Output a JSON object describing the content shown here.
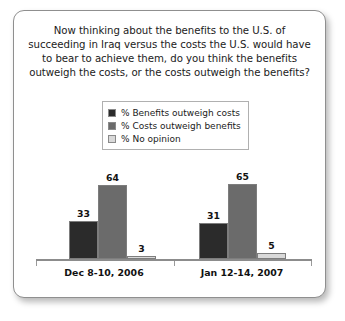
{
  "card": {
    "title": "Now thinking about the benefits to the U.S. of succeeding in Iraq versus the costs the U.S. would have to bear to achieve them, do you think the benefits outweigh the costs, or the costs outweigh the benefits?"
  },
  "chart_data": {
    "type": "bar",
    "title": "Now thinking about the benefits to the U.S. of succeeding in Iraq versus the costs the U.S. would have to bear to achieve them, do you think the benefits outweigh the costs, or the costs outweigh the benefits?",
    "xlabel": "",
    "ylabel": "",
    "ylim": [
      0,
      100
    ],
    "grid": false,
    "legend_position": "top-center",
    "categories": [
      "Dec 8-10, 2006",
      "Jan 12-14, 2007"
    ],
    "series": [
      {
        "name": "% Benefits outweigh costs",
        "color": "#2b2b2b",
        "values": [
          33,
          31
        ]
      },
      {
        "name": "% Costs outweigh benefits",
        "color": "#6b6b6b",
        "values": [
          64,
          65
        ]
      },
      {
        "name": "% No opinion",
        "color": "#d9d9d9",
        "values": [
          3,
          5
        ]
      }
    ]
  }
}
